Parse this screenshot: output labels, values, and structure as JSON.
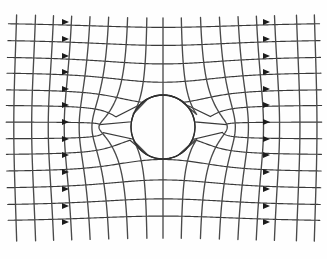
{
  "figure": {
    "background_color": "#fefefe",
    "line_color": "#3a3a3a",
    "equipotential_color": "#4a4a4a",
    "conductor_color": "#2e2e2e",
    "arrow_color": "#1c1c1c",
    "caption": ""
  },
  "chart_data": {
    "type": "line",
    "xlabel": "",
    "ylabel": "",
    "xlim": [
      13,
      315
    ],
    "ylim": [
      13,
      243
    ],
    "grid": true,
    "legend": false,
    "annotations": [],
    "conductor": {
      "shape": "circle",
      "center_x": 163,
      "center_y": 127,
      "radius": 32,
      "dipole_strength": 1024
    },
    "field_lines": {
      "name": "field-lines-horizontal",
      "orientation": "horizontal",
      "count": 13,
      "x_start": 13,
      "x_end": 315,
      "y_values": [
        22,
        39,
        56,
        72,
        89,
        105,
        122,
        139,
        155,
        172,
        189,
        206,
        222
      ]
    },
    "equipotentials": {
      "name": "equipotential-lines-vertical",
      "orientation": "vertical",
      "count": 17,
      "y_start": 13,
      "y_end": 243,
      "x_values": [
        21,
        40,
        58,
        76,
        94,
        112,
        130,
        148,
        163,
        180,
        198,
        216,
        234,
        252,
        270,
        292,
        310
      ]
    },
    "arrows": {
      "name": "flow-direction-arrows",
      "direction": "right",
      "left_column_x": 62,
      "right_column_x": 263,
      "rows": [
        22,
        39,
        56,
        72,
        89,
        105,
        122,
        139,
        155,
        172,
        189,
        206,
        222
      ],
      "size": 7
    }
  }
}
